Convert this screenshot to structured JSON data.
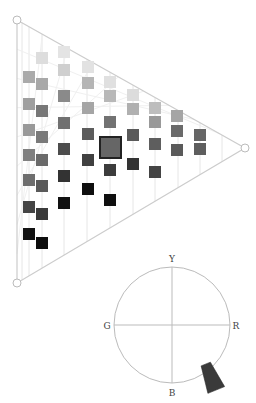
{
  "triangle": {
    "vertices": {
      "top": {
        "x": 17,
        "y": 20
      },
      "right": {
        "x": 245,
        "y": 148
      },
      "bottom": {
        "x": 17,
        "y": 283
      }
    },
    "line_color": "#cccccc",
    "grid_color": "#e6e6e6",
    "grid_x": [
      22,
      29,
      42,
      64,
      87,
      110,
      133,
      155,
      178,
      200,
      222
    ],
    "swatch_size": 12,
    "swatches": [
      {
        "x": 29,
        "y": 77,
        "color": "#aaaaaa"
      },
      {
        "x": 29,
        "y": 104,
        "color": "#9f9f9f"
      },
      {
        "x": 29,
        "y": 130,
        "color": "#999999"
      },
      {
        "x": 29,
        "y": 155,
        "color": "#808080"
      },
      {
        "x": 29,
        "y": 180,
        "color": "#6e6e6e"
      },
      {
        "x": 29,
        "y": 207,
        "color": "#444444"
      },
      {
        "x": 29,
        "y": 234,
        "color": "#111111"
      },
      {
        "x": 42,
        "y": 58,
        "color": "#dddddd"
      },
      {
        "x": 42,
        "y": 84,
        "color": "#a8a8a8"
      },
      {
        "x": 42,
        "y": 111,
        "color": "#777777"
      },
      {
        "x": 42,
        "y": 137,
        "color": "#7a7a7a"
      },
      {
        "x": 42,
        "y": 160,
        "color": "#6a6a6a"
      },
      {
        "x": 42,
        "y": 186,
        "color": "#5a5a5a"
      },
      {
        "x": 42,
        "y": 214,
        "color": "#3a3a3a"
      },
      {
        "x": 42,
        "y": 243,
        "color": "#0d0d0d"
      },
      {
        "x": 64,
        "y": 52,
        "color": "#e4e4e4"
      },
      {
        "x": 64,
        "y": 70,
        "color": "#cfcfcf"
      },
      {
        "x": 64,
        "y": 96,
        "color": "#8a8a8a"
      },
      {
        "x": 64,
        "y": 123,
        "color": "#707070"
      },
      {
        "x": 64,
        "y": 149,
        "color": "#4c4c4c"
      },
      {
        "x": 64,
        "y": 176,
        "color": "#333333"
      },
      {
        "x": 64,
        "y": 203,
        "color": "#111111"
      },
      {
        "x": 88,
        "y": 67,
        "color": "#e2e2e2"
      },
      {
        "x": 88,
        "y": 83,
        "color": "#b5b5b5"
      },
      {
        "x": 88,
        "y": 108,
        "color": "#a5a5a5"
      },
      {
        "x": 88,
        "y": 134,
        "color": "#5c5c5c"
      },
      {
        "x": 88,
        "y": 160,
        "color": "#404040"
      },
      {
        "x": 88,
        "y": 189,
        "color": "#0f0f0f"
      },
      {
        "x": 110,
        "y": 82,
        "color": "#e0e0e0"
      },
      {
        "x": 110,
        "y": 96,
        "color": "#b8b8b8"
      },
      {
        "x": 110,
        "y": 122,
        "color": "#727272"
      },
      {
        "x": 110,
        "y": 170,
        "color": "#3c3c3c"
      },
      {
        "x": 110,
        "y": 200,
        "color": "#0f0f0f"
      },
      {
        "x": 133,
        "y": 95,
        "color": "#dcdcdc"
      },
      {
        "x": 133,
        "y": 109,
        "color": "#b0b0b0"
      },
      {
        "x": 133,
        "y": 135,
        "color": "#5a5a5a"
      },
      {
        "x": 133,
        "y": 164,
        "color": "#333333"
      },
      {
        "x": 155,
        "y": 108,
        "color": "#bdbdbd"
      },
      {
        "x": 155,
        "y": 122,
        "color": "#999999"
      },
      {
        "x": 155,
        "y": 144,
        "color": "#5e5e5e"
      },
      {
        "x": 155,
        "y": 172,
        "color": "#444444"
      },
      {
        "x": 177,
        "y": 116,
        "color": "#a5a5a5"
      },
      {
        "x": 177,
        "y": 131,
        "color": "#6a6a6a"
      },
      {
        "x": 177,
        "y": 150,
        "color": "#5a5a5a"
      },
      {
        "x": 200,
        "y": 135,
        "color": "#666666"
      },
      {
        "x": 200,
        "y": 149,
        "color": "#5e5e5e"
      }
    ],
    "selected": {
      "x": 110,
      "y": 147,
      "size": 23,
      "color": "#666666",
      "border": "#222222"
    }
  },
  "hue_circle": {
    "center": {
      "x": 172,
      "y": 325
    },
    "radius": 58,
    "line_color": "#bbbbbb",
    "labels": {
      "top": "Y",
      "left": "G",
      "right": "R",
      "bottom": "B"
    },
    "pointer": {
      "x": 211,
      "y": 377,
      "angle_deg": -22,
      "color": "#3a3a3a"
    }
  }
}
